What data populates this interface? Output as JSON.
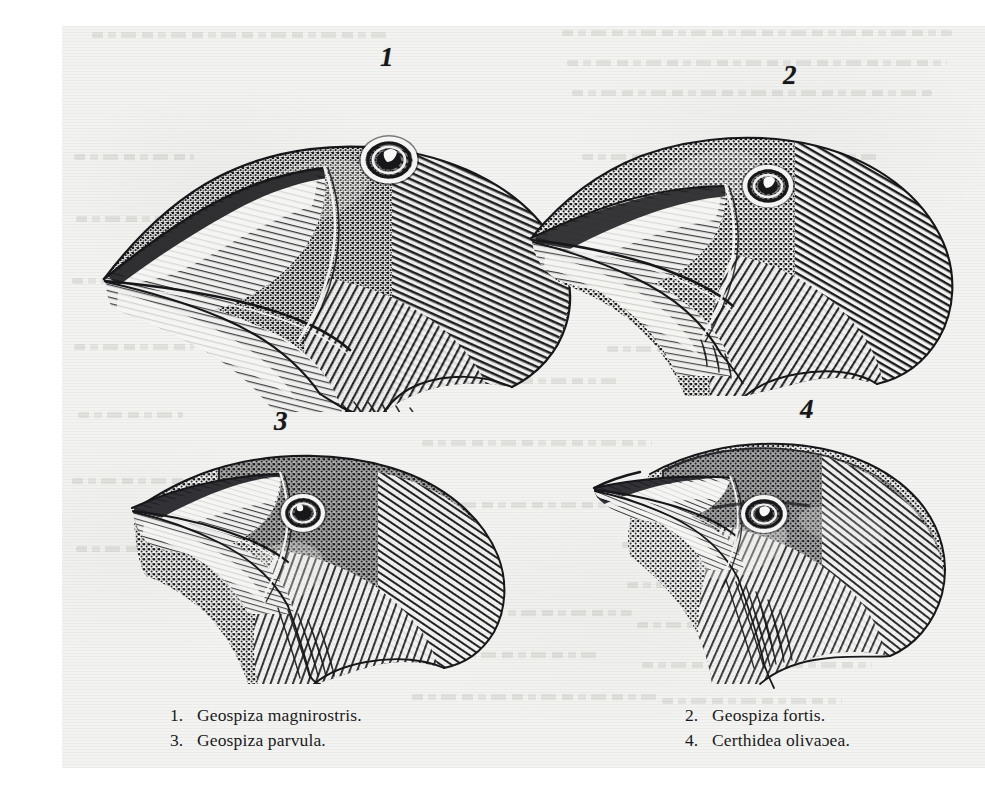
{
  "plate": {
    "medium": "wood-engraving",
    "paper_color": "#f3f3f1",
    "ink_color": "#17171a"
  },
  "figures": [
    {
      "id": "fig-1",
      "numeral": "1",
      "species": "Geospiza magnirostris",
      "beak": "very large, deep, blunt"
    },
    {
      "id": "fig-2",
      "numeral": "2",
      "species": "Geospiza fortis",
      "beak": "large, moderately deep"
    },
    {
      "id": "fig-3",
      "numeral": "3",
      "species": "Geospiza parvula",
      "beak": "small, short, conical"
    },
    {
      "id": "fig-4",
      "numeral": "4",
      "species": "Certhidea olivacea",
      "beak": "slender, fine, pointed"
    }
  ],
  "caption": {
    "left_column": [
      {
        "number": "1.",
        "name": "Geospiza magnirostris."
      },
      {
        "number": "3.",
        "name": "Geospiza parvula."
      }
    ],
    "right_column": [
      {
        "number": "2.",
        "name": "Geospiza fortis."
      },
      {
        "number": "4.",
        "name": "Certhidea olivaɔea."
      }
    ]
  }
}
